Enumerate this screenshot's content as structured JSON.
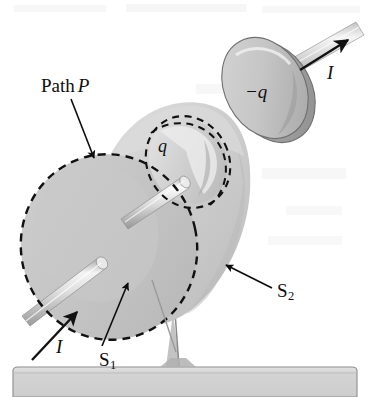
{
  "figure": {
    "canvas": {
      "width": 374,
      "height": 397,
      "background": "#ffffff"
    },
    "labels": {
      "path_p_word": "Path",
      "path_p_symbol": "P",
      "charge_negative": "−q",
      "charge_positive": "q",
      "current_top": "I",
      "current_bottom": "I",
      "surface_flat": "S",
      "surface_flat_sub": "1",
      "surface_bulge": "S",
      "surface_bulge_sub": "2"
    },
    "colors": {
      "ink": "#0d0d0d",
      "bulge_fill": "#cfcfcf",
      "bulge_fill_light": "#e2e2e2",
      "disc_fill": "#c4c4c4",
      "inner_disc_fill": "#d6d6d6",
      "rod_light": "#f2f2f2",
      "rod_mid": "#c9c9c9",
      "rod_dark": "#9e9e9e",
      "base_fill": "#d9d9d9",
      "base_stroke": "#8f8f8f",
      "ghost_text": "#f0f0f0"
    },
    "elements": {
      "upper_capacitor_plate": "negatively charged disc labeled -q with rod carrying current I out of frame top-right",
      "lower_capacitor_plate": "positively charged disc labeled q with rod carrying current I into frame bottom-left",
      "flat_surface": "S1 flat circular surface bounded by dashed path P",
      "bulge_surface": "S2 balloon-shaped surface sharing the same dashed boundary path P",
      "dashed_boundary": "Path P dashed ellipse forming the common rim of S1 and S2",
      "stand": "thin support post resting on a grey base slab"
    }
  }
}
